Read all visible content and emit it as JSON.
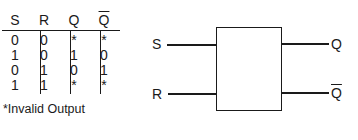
{
  "truth_table": {
    "headers": [
      "S",
      "R",
      "Q",
      "Q"
    ],
    "header_overline": [
      false,
      false,
      false,
      true
    ],
    "rows": [
      [
        "0",
        "0",
        "*",
        "*"
      ],
      [
        "1",
        "0",
        "1",
        "0"
      ],
      [
        "0",
        "1",
        "0",
        "1"
      ],
      [
        "1",
        "1",
        "*",
        "*"
      ]
    ],
    "footnote": "*Invalid Output"
  },
  "diagram": {
    "inputs": [
      "S",
      "R"
    ],
    "outputs": [
      "Q",
      "Q"
    ],
    "output_overline": [
      false,
      true
    ]
  }
}
